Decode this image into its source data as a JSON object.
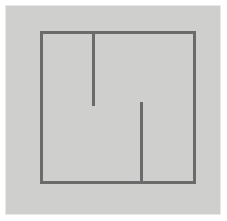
{
  "figure": {
    "title": "abstract-line-drawing",
    "description": "Grey square panel containing an open rectangular outline with two interior vertical line segments",
    "canvas": {
      "width": 227,
      "height": 221,
      "background_color": "#ffffff"
    },
    "panel": {
      "name": "grey-panel",
      "x": 5,
      "y": 5,
      "width": 215,
      "height": 209,
      "fill_color": "#cfcfce",
      "edge_color": "#e8e8e7"
    },
    "stroke": {
      "color": "#6b6b6b",
      "width": 3,
      "linecap": "butt"
    },
    "shapes": [
      {
        "name": "outer-rectangle",
        "type": "rect",
        "x": 41,
        "y": 32,
        "width": 153,
        "height": 150,
        "fill": "none"
      },
      {
        "name": "vertical-segment-upper",
        "type": "line",
        "x1": 93,
        "y1": 32,
        "x2": 93,
        "y2": 106
      },
      {
        "name": "vertical-segment-lower",
        "type": "line",
        "x1": 141,
        "y1": 102,
        "x2": 141,
        "y2": 182
      }
    ]
  }
}
